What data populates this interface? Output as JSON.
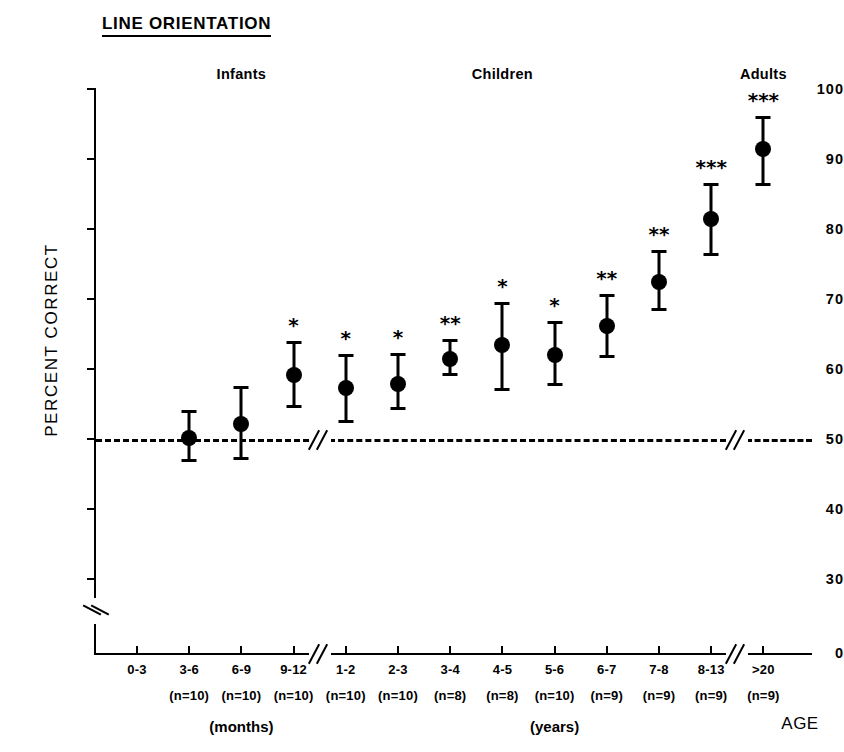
{
  "chart_data": {
    "type": "scatter",
    "title": "LINE ORIENTATION",
    "xlabel": "AGE",
    "ylabel": "PERCENT CORRECT",
    "ylim": [
      0,
      100
    ],
    "y_ticks": [
      100,
      90,
      80,
      70,
      60,
      50,
      40,
      30,
      0
    ],
    "y_axis_break_between": [
      0,
      30
    ],
    "grid": false,
    "legend": null,
    "chance_level": 50,
    "chance_line_style": "dashed",
    "x_axis_breaks_after": [
      "9-12",
      "8-13"
    ],
    "group_headers": [
      {
        "label": "Infants",
        "x_center_category": "6-9"
      },
      {
        "label": "Children",
        "x_center_category": "4-5"
      },
      {
        "label": "Adults",
        "x_center_category": ">20"
      }
    ],
    "unit_labels": [
      {
        "label": "(months)",
        "x_center_category": "6-9"
      },
      {
        "label": "(years)",
        "x_center_category": "5-6"
      }
    ],
    "significance_key": {
      "1": "*",
      "2": "**",
      "3": "***"
    },
    "categories": [
      "0-3",
      "3-6",
      "6-9",
      "9-12",
      "1-2",
      "2-3",
      "3-4",
      "4-5",
      "5-6",
      "6-7",
      "7-8",
      "8-13",
      ">20"
    ],
    "n_labels": [
      "",
      "(n=10)",
      "(n=10)",
      "(n=10)",
      "(n=10)",
      "(n=10)",
      "(n=8)",
      "(n=8)",
      "(n=10)",
      "(n=9)",
      "(n=9)",
      "(n=9)",
      "(n=9)"
    ],
    "points": [
      {
        "category": "0-3",
        "n_label": "",
        "value": null,
        "low": null,
        "high": null,
        "stars": ""
      },
      {
        "category": "3-6",
        "n_label": "(n=10)",
        "value": 50.2,
        "low": 46.9,
        "high": 54.0,
        "stars": ""
      },
      {
        "category": "6-9",
        "n_label": "(n=10)",
        "value": 52.2,
        "low": 47.1,
        "high": 57.4,
        "stars": ""
      },
      {
        "category": "9-12",
        "n_label": "(n=10)",
        "value": 59.1,
        "low": 54.6,
        "high": 63.9,
        "stars": "*"
      },
      {
        "category": "1-2",
        "n_label": "(n=10)",
        "value": 57.3,
        "low": 52.4,
        "high": 62.0,
        "stars": "*"
      },
      {
        "category": "2-3",
        "n_label": "(n=10)",
        "value": 57.8,
        "low": 54.3,
        "high": 62.1,
        "stars": "*"
      },
      {
        "category": "3-4",
        "n_label": "(n=8)",
        "value": 61.4,
        "low": 59.1,
        "high": 64.1,
        "stars": "**"
      },
      {
        "category": "4-5",
        "n_label": "(n=8)",
        "value": 63.4,
        "low": 57.0,
        "high": 69.4,
        "stars": "*"
      },
      {
        "category": "5-6",
        "n_label": "(n=10)",
        "value": 62.0,
        "low": 57.7,
        "high": 66.7,
        "stars": "*"
      },
      {
        "category": "6-7",
        "n_label": "(n=9)",
        "value": 66.2,
        "low": 61.7,
        "high": 70.6,
        "stars": "**"
      },
      {
        "category": "7-8",
        "n_label": "(n=9)",
        "value": 72.5,
        "low": 68.4,
        "high": 76.9,
        "stars": "**"
      },
      {
        "category": "8-13",
        "n_label": "(n=9)",
        "value": 81.4,
        "low": 76.3,
        "high": 86.4,
        "stars": "***"
      },
      {
        "category": ">20",
        "n_label": "(n=9)",
        "value": 91.4,
        "low": 86.3,
        "high": 96.0,
        "stars": "***"
      }
    ]
  }
}
